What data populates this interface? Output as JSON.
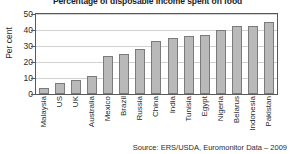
{
  "chart_data": {
    "type": "bar",
    "title": "Percentage of disposable income spent on food",
    "xlabel": "",
    "ylabel": "Per cent",
    "ylim": [
      0,
      50
    ],
    "yticks": [
      0,
      10,
      20,
      30,
      40,
      50
    ],
    "grid": true,
    "legend": false,
    "categories": [
      "Malaysia",
      "US",
      "UK",
      "Australia",
      "Mexico",
      "Brazil",
      "Russia",
      "China",
      "India",
      "Tunisia",
      "Egypt",
      "Nigeria",
      "Belarus",
      "Indonesia",
      "Pakistan"
    ],
    "values": [
      3.5,
      7,
      9,
      11,
      24,
      25,
      28,
      33,
      35,
      36,
      37,
      40,
      42.5,
      42.5,
      45
    ],
    "source": "Source: ERS/USDA, Euromonitor Data – 2009",
    "bar_color": "#b9b9b9",
    "bar_border_color": "#7b7b7b",
    "grid_color": "#d2d2d2",
    "axis_color": "#58585a"
  }
}
